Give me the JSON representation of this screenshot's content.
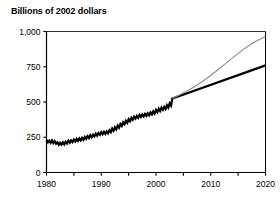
{
  "chart_data": {
    "type": "line",
    "title": "Billions of 2002 dollars",
    "xlabel": "",
    "ylabel": "",
    "xlim": [
      1980,
      2020
    ],
    "ylim": [
      0,
      1000
    ],
    "grid": false,
    "legend": "none",
    "yticks": [
      0,
      250,
      500,
      750,
      1000
    ],
    "ytick_labels": [
      "0",
      "250",
      "500",
      "750",
      "1,000"
    ],
    "xticks": [
      1980,
      1985,
      1990,
      1995,
      2000,
      2005,
      2010,
      2015,
      2020
    ],
    "xtick_labels_shown": [
      "1980",
      "1990",
      "2000",
      "2010",
      "2020"
    ],
    "xtick_labels_positions": [
      1980,
      1990,
      2000,
      2010,
      2020
    ],
    "series": [
      {
        "name": "Historical (actual)",
        "style": "jagged-quarterly",
        "color": "#000000",
        "width": 2.2,
        "x": [
          1980.0,
          1980.25,
          1980.5,
          1980.75,
          1981.0,
          1981.25,
          1981.5,
          1981.75,
          1982.0,
          1982.25,
          1982.5,
          1982.75,
          1983.0,
          1983.25,
          1983.5,
          1983.75,
          1984.0,
          1984.25,
          1984.5,
          1984.75,
          1985.0,
          1985.25,
          1985.5,
          1985.75,
          1986.0,
          1986.25,
          1986.5,
          1986.75,
          1987.0,
          1987.25,
          1987.5,
          1987.75,
          1988.0,
          1988.25,
          1988.5,
          1988.75,
          1989.0,
          1989.25,
          1989.5,
          1989.75,
          1990.0,
          1990.25,
          1990.5,
          1990.75,
          1991.0,
          1991.25,
          1991.5,
          1991.75,
          1992.0,
          1992.25,
          1992.5,
          1992.75,
          1993.0,
          1993.25,
          1993.5,
          1993.75,
          1994.0,
          1994.25,
          1994.5,
          1994.75,
          1995.0,
          1995.25,
          1995.5,
          1995.75,
          1996.0,
          1996.25,
          1996.5,
          1996.75,
          1997.0,
          1997.25,
          1997.5,
          1997.75,
          1998.0,
          1998.25,
          1998.5,
          1998.75,
          1999.0,
          1999.25,
          1999.5,
          1999.75,
          2000.0,
          2000.25,
          2000.5,
          2000.75,
          2001.0,
          2001.25,
          2001.5,
          2001.75,
          2002.0,
          2002.25,
          2002.5,
          2002.75,
          2003.0
        ],
        "values": [
          232,
          214,
          226,
          210,
          228,
          208,
          222,
          204,
          214,
          196,
          210,
          198,
          214,
          200,
          218,
          206,
          226,
          212,
          228,
          216,
          234,
          220,
          238,
          224,
          242,
          228,
          246,
          232,
          252,
          238,
          258,
          244,
          264,
          250,
          268,
          256,
          276,
          262,
          280,
          268,
          286,
          272,
          288,
          274,
          292,
          278,
          300,
          286,
          312,
          296,
          320,
          306,
          332,
          318,
          344,
          330,
          356,
          342,
          366,
          352,
          378,
          364,
          388,
          374,
          396,
          382,
          402,
          388,
          408,
          394,
          412,
          398,
          416,
          402,
          420,
          406,
          426,
          412,
          434,
          418,
          444,
          428,
          452,
          436,
          460,
          444,
          466,
          450,
          476,
          460,
          490,
          474,
          530
        ]
      },
      {
        "name": "Projection (lower, straight)",
        "style": "straight",
        "color": "#000000",
        "width": 2.2,
        "x": [
          2003,
          2020
        ],
        "values": [
          525,
          760
        ]
      },
      {
        "name": "Projection (upper, curved)",
        "style": "curved",
        "color": "#8c8c8c",
        "width": 1.1,
        "x": [
          2003,
          2006,
          2009,
          2012,
          2015,
          2018,
          2020
        ],
        "values": [
          525,
          585,
          660,
          750,
          845,
          925,
          965
        ]
      }
    ],
    "colors": {
      "axis": "#000000",
      "historical": "#000000",
      "projection_black": "#000000",
      "projection_gray": "#8c8c8c",
      "background": "#ffffff"
    }
  }
}
